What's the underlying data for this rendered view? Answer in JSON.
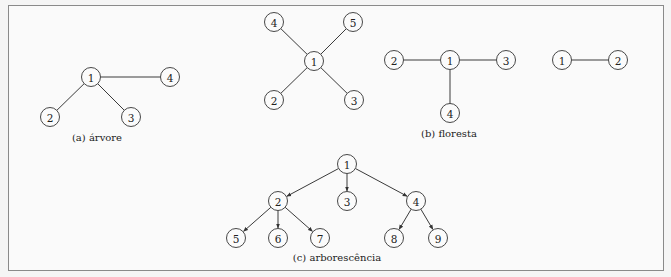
{
  "figure": {
    "subfigures": [
      {
        "id": "a",
        "caption": "(a) árvore",
        "caption_pos": [
          97,
          141
        ],
        "directed": false,
        "nodes": [
          {
            "label": "1",
            "x": 91,
            "y": 77
          },
          {
            "label": "4",
            "x": 170,
            "y": 77
          },
          {
            "label": "2",
            "x": 50,
            "y": 117
          },
          {
            "label": "3",
            "x": 131,
            "y": 117
          }
        ],
        "edges": [
          [
            0,
            1
          ],
          [
            0,
            2
          ],
          [
            0,
            3
          ]
        ]
      },
      {
        "id": "b",
        "caption": "(b) floresta",
        "caption_pos": [
          449,
          137
        ],
        "directed": false,
        "components": [
          {
            "nodes": [
              {
                "label": "4",
                "x": 274,
                "y": 22
              },
              {
                "label": "5",
                "x": 353,
                "y": 22
              },
              {
                "label": "1",
                "x": 314,
                "y": 61
              },
              {
                "label": "2",
                "x": 274,
                "y": 100
              },
              {
                "label": "3",
                "x": 354,
                "y": 100
              }
            ],
            "edges": [
              [
                2,
                0
              ],
              [
                2,
                1
              ],
              [
                2,
                3
              ],
              [
                2,
                4
              ]
            ]
          },
          {
            "nodes": [
              {
                "label": "2",
                "x": 394,
                "y": 60
              },
              {
                "label": "1",
                "x": 450,
                "y": 60
              },
              {
                "label": "3",
                "x": 506,
                "y": 60
              },
              {
                "label": "4",
                "x": 450,
                "y": 113
              }
            ],
            "edges": [
              [
                1,
                0
              ],
              [
                1,
                2
              ],
              [
                1,
                3
              ]
            ]
          },
          {
            "nodes": [
              {
                "label": "1",
                "x": 562,
                "y": 60
              },
              {
                "label": "2",
                "x": 618,
                "y": 60
              }
            ],
            "edges": [
              [
                0,
                1
              ]
            ]
          }
        ]
      },
      {
        "id": "c",
        "caption": "(c) arborescência",
        "caption_pos": [
          337,
          261
        ],
        "directed": true,
        "nodes": [
          {
            "label": "1",
            "x": 347,
            "y": 164
          },
          {
            "label": "2",
            "x": 278,
            "y": 201
          },
          {
            "label": "3",
            "x": 347,
            "y": 201
          },
          {
            "label": "4",
            "x": 416,
            "y": 201
          },
          {
            "label": "5",
            "x": 236,
            "y": 238
          },
          {
            "label": "6",
            "x": 278,
            "y": 238
          },
          {
            "label": "7",
            "x": 320,
            "y": 238
          },
          {
            "label": "8",
            "x": 394,
            "y": 238
          },
          {
            "label": "9",
            "x": 438,
            "y": 238
          }
        ],
        "edges": [
          [
            0,
            1
          ],
          [
            0,
            2
          ],
          [
            0,
            3
          ],
          [
            1,
            4
          ],
          [
            1,
            5
          ],
          [
            1,
            6
          ],
          [
            3,
            7
          ],
          [
            3,
            8
          ]
        ]
      }
    ],
    "node_radius": 9.5
  }
}
